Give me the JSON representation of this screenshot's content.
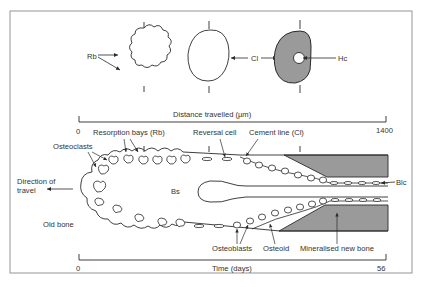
{
  "figure": {
    "top_section": {
      "labels": {
        "rb": "Rb",
        "cl": "Cl",
        "hc": "Hc"
      },
      "axis": {
        "title": "Distance travelled (µm)",
        "start": "0",
        "end": "1400"
      }
    },
    "main_section": {
      "labels": {
        "resorption_bays": "Resorption bays (Rb)",
        "reversal_cell": "Reversal cell",
        "cement_line": "Cement line (Cl)",
        "osteoclasts": "Osteoclasts",
        "direction_line1": "Direction of",
        "direction_line2": "travel",
        "bs": "Bs",
        "blc": "Blc",
        "old_bone": "Old bone",
        "osteoblasts": "Osteoblasts",
        "osteoid": "Osteoid",
        "mineralised_new_bone": "Mineralised new bone"
      },
      "axis": {
        "title": "Time (days)",
        "start": "0",
        "end": "56"
      }
    },
    "colors": {
      "line": "#2a2a2a",
      "mineralised_fill": "#9a9a9a",
      "frame": "#8a8a8a",
      "text": "#333333"
    }
  }
}
